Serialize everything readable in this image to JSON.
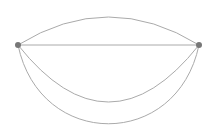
{
  "diagram": {
    "type": "multigraph",
    "width": 218,
    "height": 138,
    "colors": {
      "background": "#ffffff",
      "edge": "#aaaaaa",
      "node": "#777777"
    },
    "nodes": [
      {
        "id": "left",
        "x": 18,
        "y": 45,
        "r": 3
      },
      {
        "id": "right",
        "x": 199,
        "y": 45,
        "r": 3
      }
    ],
    "edges": [
      {
        "id": "edge-top-arc",
        "from": "left",
        "to": "right",
        "path": "M18,45 Q108.5,-11 199,45"
      },
      {
        "id": "edge-straight",
        "from": "left",
        "to": "right",
        "path": "M18,45 L199,45"
      },
      {
        "id": "edge-middle-arc",
        "from": "left",
        "to": "right",
        "path": "M18,45 Q108.5,159 199,45"
      },
      {
        "id": "edge-bottom-arc",
        "from": "left",
        "to": "right",
        "path": "M18,45 C40,150 177,150 199,45"
      }
    ]
  }
}
